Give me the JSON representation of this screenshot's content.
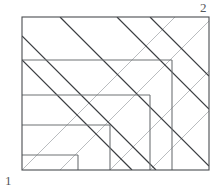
{
  "figure": {
    "type": "line-diagram",
    "canvas": {
      "width": 221,
      "height": 196
    },
    "colors": {
      "frame": "#4a4d50",
      "grid": "#6e7275",
      "diagonal_dark": "#3a3d40",
      "diagonal_light": "#b9bcbf",
      "label": "#55585b",
      "background": "#ffffff"
    },
    "stroke_widths": {
      "frame": 1.1,
      "grid": 1.1,
      "diagonal_dark": 1.2,
      "diagonal_light": 1.0
    },
    "frame": {
      "x1": 22,
      "y1": 17,
      "x2": 209,
      "y2": 170
    },
    "horizontal_lines": [
      {
        "x1": 22,
        "y": 60,
        "x2": 172
      },
      {
        "x1": 22,
        "y": 95,
        "x2": 150
      },
      {
        "x1": 22,
        "y": 125,
        "x2": 110
      },
      {
        "x1": 22,
        "y": 155,
        "x2": 78
      }
    ],
    "vertical_lines": [
      {
        "x": 172,
        "y1": 60,
        "y2": 170
      },
      {
        "x": 150,
        "y1": 95,
        "y2": 170
      },
      {
        "x": 110,
        "y1": 125,
        "y2": 170
      },
      {
        "x": 78,
        "y1": 155,
        "y2": 170
      }
    ],
    "diagonals_dark": [
      {
        "x1": 22,
        "y1": 60,
        "x2": 132,
        "y2": 170
      },
      {
        "x1": 22,
        "y1": 36,
        "x2": 156,
        "y2": 170
      },
      {
        "x1": 60,
        "y1": 17,
        "x2": 209,
        "y2": 166
      },
      {
        "x1": 117,
        "y1": 17,
        "x2": 209,
        "y2": 109
      },
      {
        "x1": 150,
        "y1": 17,
        "x2": 209,
        "y2": 76
      }
    ],
    "diagonals_light": [
      {
        "x1": 22,
        "y1": 170,
        "x2": 175,
        "y2": 17
      },
      {
        "x1": 22,
        "y1": 170,
        "x2": 70,
        "y2": 122
      },
      {
        "x1": 60,
        "y1": 170,
        "x2": 209,
        "y2": 21
      },
      {
        "x1": 110,
        "y1": 170,
        "x2": 209,
        "y2": 71
      },
      {
        "x1": 150,
        "y1": 170,
        "x2": 209,
        "y2": 111
      }
    ],
    "labels": {
      "bottom_left": "1",
      "top_right": "2"
    }
  }
}
